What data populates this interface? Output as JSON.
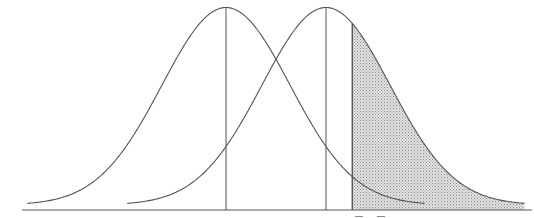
{
  "diagram": {
    "title": "",
    "distributions": [
      {
        "name": "left-distribution",
        "mean": 0,
        "sd": 1,
        "mean_line": true
      },
      {
        "name": "right-distribution",
        "mean": 1.56,
        "sd": 1,
        "mean_line": true
      }
    ],
    "critical_value": 1.97,
    "shaded_region": {
      "of": "right-distribution",
      "from": 1.97,
      "to": "upper-tail"
    },
    "x_range": [
      -3.1,
      4.8
    ],
    "colors": {
      "line": "#555555",
      "shade": "#c8c8c8",
      "background": "#ffffff"
    }
  }
}
